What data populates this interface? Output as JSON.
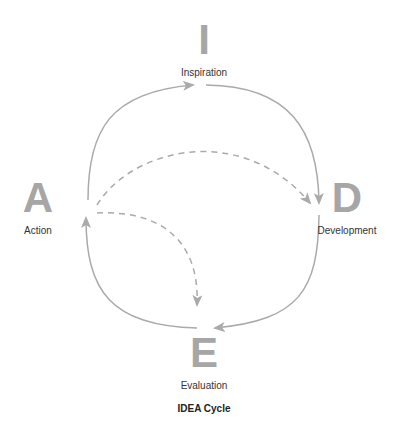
{
  "diagram": {
    "title": "IDEA Cycle",
    "colors": {
      "letter": "#a6a6a6",
      "arrow": "#aaaaaa",
      "label": "#333333",
      "caption": "#222222"
    },
    "nodes": [
      {
        "id": "I",
        "letter": "I",
        "label": "Inspiration",
        "position": "top"
      },
      {
        "id": "D",
        "letter": "D",
        "label": "Development",
        "position": "right"
      },
      {
        "id": "E",
        "letter": "E",
        "label": "Evaluation",
        "position": "bottom"
      },
      {
        "id": "A",
        "letter": "A",
        "label": "Action",
        "position": "left"
      }
    ],
    "edges": [
      {
        "from": "A",
        "to": "I",
        "style": "solid"
      },
      {
        "from": "I",
        "to": "D",
        "style": "solid"
      },
      {
        "from": "D",
        "to": "E",
        "style": "solid"
      },
      {
        "from": "E",
        "to": "A",
        "style": "solid"
      },
      {
        "from": "A",
        "to": "D",
        "style": "dashed"
      },
      {
        "from": "A",
        "to": "E",
        "style": "dashed"
      }
    ]
  }
}
